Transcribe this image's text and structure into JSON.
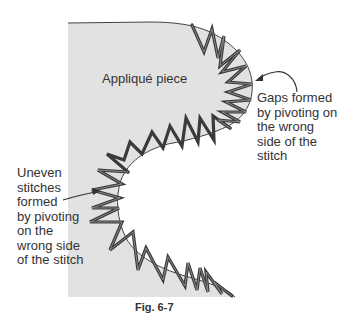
{
  "figure": {
    "caption": "Fig. 6-7",
    "fill_color": "#e2e2e2",
    "stitch_color": "#444444",
    "labels": {
      "piece": "Appliqué piece",
      "gaps": "Gaps formed\nby pivoting on\nthe wrong\nside of the\nstitch",
      "uneven": "Uneven\nstitches\nformed\nby pivoting\non the\nwrong side\nof the stitch"
    }
  }
}
